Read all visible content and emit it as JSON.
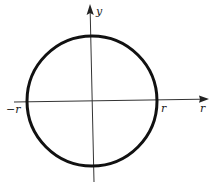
{
  "diagram": {
    "type": "circle-on-cartesian-axes",
    "colors": {
      "circle": "#111111",
      "axes": "#333333",
      "text": "#1a1a1a",
      "background": "#ffffff"
    },
    "circle": {
      "cx": 92,
      "cy": 101,
      "r": 65,
      "stroke_width": 3
    },
    "x_axis": {
      "x1": 14,
      "y1": 102,
      "x2": 205,
      "y2": 99,
      "arrow": "right"
    },
    "y_axis": {
      "x1": 94,
      "y1": 182,
      "x2": 90,
      "y2": 8,
      "arrow": "up"
    },
    "labels": {
      "y_axis": "y",
      "x_axis": "r",
      "neg_r": "−r",
      "pos_r": "r"
    }
  }
}
